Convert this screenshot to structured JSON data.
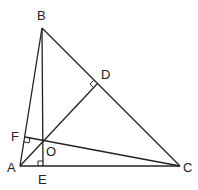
{
  "diagram": {
    "type": "geometry",
    "points": {
      "A": {
        "label": "A",
        "x": 20,
        "y": 166,
        "lx": 7,
        "ly": 172
      },
      "B": {
        "label": "B",
        "x": 42,
        "y": 28,
        "lx": 37,
        "ly": 20
      },
      "C": {
        "label": "C",
        "x": 180,
        "y": 166,
        "lx": 183,
        "ly": 172
      },
      "D": {
        "label": "D",
        "x": 97,
        "y": 84,
        "lx": 101,
        "ly": 79
      },
      "E": {
        "label": "E",
        "x": 43,
        "y": 166,
        "lx": 38,
        "ly": 184
      },
      "F": {
        "label": "F",
        "x": 25,
        "y": 137,
        "lx": 11,
        "ly": 141
      },
      "O": {
        "label": "O",
        "x": 43,
        "y": 141,
        "lx": 46,
        "ly": 156
      }
    },
    "segments": [
      [
        "A",
        "B"
      ],
      [
        "B",
        "C"
      ],
      [
        "A",
        "C"
      ],
      [
        "A",
        "D"
      ],
      [
        "B",
        "E"
      ],
      [
        "C",
        "F"
      ]
    ],
    "right_angles": [
      "D",
      "E",
      "F"
    ],
    "stroke_color": "#222222"
  }
}
